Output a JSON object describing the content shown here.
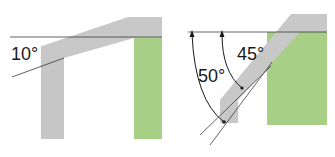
{
  "colors": {
    "beam_gray": "#c8c8c8",
    "post_gray": "#c6c6c6",
    "green": "#a8cf86",
    "line": "#3a3a3a",
    "background": "#ffffff"
  },
  "left_panel": {
    "angle_label": "10°",
    "angle_deg": 10
  },
  "right_panel": {
    "angle_label_inner": "45°",
    "angle_label_outer": "50°",
    "inner_angle_deg": 45,
    "outer_angle_deg": 50
  }
}
